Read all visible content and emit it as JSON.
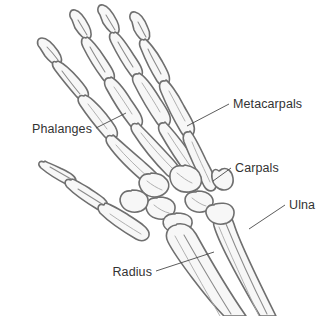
{
  "figure": {
    "background_color": "#ffffff",
    "bone_fill": "#f7f7f7",
    "bone_outline": "#6f6f6f",
    "bone_shade": "#c2c2c2",
    "label_color": "#333333",
    "leader_color": "#4a4a4a"
  },
  "labels": {
    "metacarpals": "Metacarpals",
    "phalanges": "Phalanges",
    "carpals": "Carpals",
    "ulna": "Ulna",
    "radius": "Radius"
  }
}
